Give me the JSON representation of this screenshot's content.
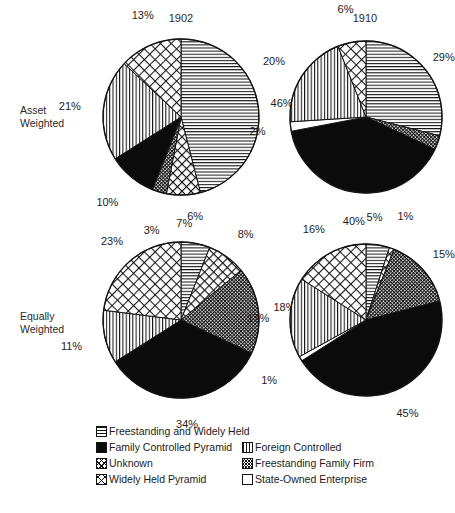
{
  "figure": {
    "columns": [
      {
        "id": "col-1902",
        "label": "1902"
      },
      {
        "id": "col-1910",
        "label": "1910"
      }
    ],
    "rows": [
      {
        "id": "row-asset",
        "line1": "Asset",
        "line2": "Weighted"
      },
      {
        "id": "row-equal",
        "line1": "Equally",
        "line2": "Weighted"
      }
    ]
  },
  "legend": {
    "items": [
      {
        "key": "freestanding_widely_held",
        "label": "Freestanding and Widely Held",
        "pattern": "horizontal-lines",
        "swatch_class": "sw-horiz",
        "column": "left",
        "row": 0
      },
      {
        "key": "family_controlled_pyramid",
        "label": "Family Controlled Pyramid",
        "pattern": "solid-black",
        "swatch_class": "sw-solid",
        "column": "left",
        "row": 1
      },
      {
        "key": "foreign_controlled",
        "label": "Foreign Controlled",
        "pattern": "vertical-lines",
        "swatch_class": "sw-vert",
        "column": "right",
        "row": 1
      },
      {
        "key": "unknown",
        "label": "Unknown",
        "pattern": "diagonal-crosshatch",
        "swatch_class": "sw-diag",
        "column": "left",
        "row": 2
      },
      {
        "key": "freestanding_family_firm",
        "label": "Freestanding Family Firm",
        "pattern": "fine-stipple",
        "swatch_class": "sw-stipple",
        "column": "right",
        "row": 2
      },
      {
        "key": "widely_held_pyramid",
        "label": "Widely Held Pyramid",
        "pattern": "x-crosshatch",
        "swatch_class": "sw-x",
        "column": "left",
        "row": 3
      },
      {
        "key": "state_owned_enterprise",
        "label": "State-Owned Enterprise",
        "pattern": "empty-white",
        "swatch_class": "sw-empty",
        "column": "right",
        "row": 3
      }
    ]
  },
  "chart_data": [
    {
      "id": "pie-asset-1902",
      "type": "pie",
      "title": "1902",
      "row": "Asset Weighted",
      "start_angle_deg": 0,
      "direction": "clockwise",
      "categories": [
        "Freestanding and Widely Held",
        "Widely Held Pyramid",
        "Freestanding Family Firm",
        "Family Controlled Pyramid",
        "Foreign Controlled",
        "Unknown"
      ],
      "values": [
        46,
        7,
        3,
        10,
        21,
        13
      ],
      "labels": [
        "46%",
        "7%",
        "3%",
        "10%",
        "21%",
        "13%"
      ],
      "patterns": [
        "horizontal-lines",
        "x-crosshatch",
        "fine-stipple",
        "solid-black",
        "vertical-lines",
        "diagonal-crosshatch"
      ]
    },
    {
      "id": "pie-asset-1910",
      "type": "pie",
      "title": "1910",
      "row": "Asset Weighted",
      "start_angle_deg": 0,
      "direction": "clockwise",
      "categories": [
        "Freestanding and Widely Held",
        "Freestanding Family Firm",
        "Family Controlled Pyramid",
        "State-Owned Enterprise",
        "Foreign Controlled",
        "Unknown"
      ],
      "values": [
        29,
        3,
        40,
        2,
        20,
        6
      ],
      "labels": [
        "29%",
        "3%",
        "40%",
        "2%",
        "20%",
        "6%"
      ],
      "patterns": [
        "horizontal-lines",
        "fine-stipple",
        "solid-black",
        "empty-white",
        "vertical-lines",
        "diagonal-crosshatch"
      ]
    },
    {
      "id": "pie-equal-1902",
      "type": "pie",
      "title": "1902",
      "row": "Equally Weighted",
      "start_angle_deg": 0,
      "direction": "clockwise",
      "categories": [
        "Freestanding and Widely Held",
        "Widely Held Pyramid",
        "Freestanding Family Firm",
        "Family Controlled Pyramid",
        "Foreign Controlled",
        "Unknown"
      ],
      "values": [
        6,
        8,
        18,
        34,
        11,
        23
      ],
      "labels": [
        "6%",
        "8%",
        "18%",
        "34%",
        "11%",
        "23%"
      ],
      "patterns": [
        "horizontal-lines",
        "x-crosshatch",
        "fine-stipple",
        "solid-black",
        "vertical-lines",
        "diagonal-crosshatch"
      ]
    },
    {
      "id": "pie-equal-1910",
      "type": "pie",
      "title": "1910",
      "row": "Equally Weighted",
      "start_angle_deg": 0,
      "direction": "clockwise",
      "categories": [
        "Freestanding and Widely Held",
        "Widely Held Pyramid",
        "Freestanding Family Firm",
        "Family Controlled Pyramid",
        "State-Owned Enterprise",
        "Foreign Controlled",
        "Unknown"
      ],
      "values": [
        5,
        1,
        15,
        45,
        1,
        17,
        16
      ],
      "labels": [
        "5%",
        "1%",
        "15%",
        "45%",
        "1%",
        "17%",
        "16%"
      ],
      "patterns": [
        "horizontal-lines",
        "x-crosshatch",
        "fine-stipple",
        "solid-black",
        "empty-white",
        "vertical-lines",
        "diagonal-crosshatch"
      ]
    }
  ],
  "colors": {
    "ink": "#141414",
    "background": "#ffffff"
  }
}
